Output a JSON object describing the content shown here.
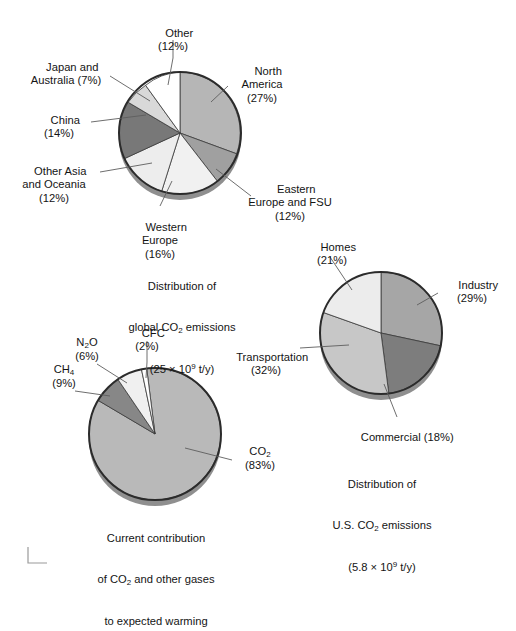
{
  "figure": {
    "background": "#ffffff",
    "crop_mark": "corner-registration-mark"
  },
  "chart_data": [
    {
      "type": "pie",
      "id": "global-co2",
      "title": "Distribution of global CO2 emissions",
      "caption_line1": "Distribution of",
      "caption_line2_pre": "global CO",
      "caption_line2_sub": "2",
      "caption_line2_post": " emissions",
      "caption_line3_pre": "(25 × 10",
      "caption_line3_sup": "9",
      "caption_line3_post": " t/y)",
      "total_label": "25 × 10^9 t/y",
      "categories": [
        "North America",
        "Eastern Europe and FSU",
        "Western Europe",
        "Other Asia and Oceania",
        "China",
        "Japan and Australia",
        "Other"
      ],
      "values": [
        27,
        12,
        16,
        12,
        14,
        7,
        12
      ],
      "colors": [
        "#b6b6b6",
        "#a0a0a0",
        "#f1f1f1",
        "#ededed",
        "#787878",
        "#d9d9d9",
        "#ffffff"
      ],
      "labels": [
        {
          "name": "north-america",
          "text": "North\nAmerica\n(27%)",
          "percent": 27
        },
        {
          "name": "eastern-europe-fsu",
          "text": "Eastern\nEurope and FSU\n(12%)",
          "percent": 12
        },
        {
          "name": "western-europe",
          "text": "Western\nEurope\n(16%)",
          "percent": 16
        },
        {
          "name": "other-asia-oceania",
          "text": "Other Asia\nand Oceania\n(12%)",
          "percent": 12
        },
        {
          "name": "china",
          "text": "China\n(14%)",
          "percent": 14
        },
        {
          "name": "japan-australia",
          "text": "Japan and\nAustralia (7%)",
          "percent": 7
        },
        {
          "name": "other",
          "text": "Other\n(12%)",
          "percent": 12
        }
      ]
    },
    {
      "type": "pie",
      "id": "us-co2",
      "title": "Distribution of U.S. CO2 emissions",
      "caption_line1": "Distribution of",
      "caption_line2_pre": "U.S. CO",
      "caption_line2_sub": "2",
      "caption_line2_post": " emissions",
      "caption_line3_pre": "(5.8 × 10",
      "caption_line3_sup": "9",
      "caption_line3_post": " t/y)",
      "total_label": "5.8 × 10^9 t/y",
      "categories": [
        "Industry",
        "Commercial",
        "Transportation",
        "Homes"
      ],
      "values": [
        29,
        18,
        32,
        21
      ],
      "colors": [
        "#a6a6a6",
        "#7d7d7d",
        "#c7c7c7",
        "#ececec"
      ],
      "labels": [
        {
          "name": "industry",
          "text": "Industry\n(29%)",
          "percent": 29
        },
        {
          "name": "commercial",
          "text": "Commercial (18%)",
          "percent": 18
        },
        {
          "name": "transportation",
          "text": "Transportation\n(32%)",
          "percent": 32
        },
        {
          "name": "homes",
          "text": "Homes\n(21%)",
          "percent": 21
        }
      ]
    },
    {
      "type": "pie",
      "id": "warming-gases",
      "title": "Current contribution of CO2 and other gases to expected warming",
      "caption_line1": "Current contribution",
      "caption_line2_pre": "of CO",
      "caption_line2_sub": "2",
      "caption_line2_post": " and other gases",
      "caption_line3": "to expected warming",
      "categories": [
        "CO2",
        "CH4",
        "N2O",
        "CFC"
      ],
      "values": [
        83,
        9,
        6,
        2
      ],
      "colors": [
        "#b9b9b9",
        "#878787",
        "#f0f0f0",
        "#ffffff"
      ],
      "labels": [
        {
          "name": "co2",
          "text_pre": "CO",
          "text_sub": "2",
          "text_post": "\n(83%)",
          "percent": 83
        },
        {
          "name": "ch4",
          "text_pre": "CH",
          "text_sub": "4",
          "text_post": "\n(9%)",
          "percent": 9
        },
        {
          "name": "n2o",
          "text_pre": "N",
          "text_sub": "2",
          "text_mid": "O",
          "text_post": "\n(6%)",
          "percent": 6
        },
        {
          "name": "cfc",
          "text": "CFC\n(2%)",
          "percent": 2
        }
      ]
    }
  ]
}
